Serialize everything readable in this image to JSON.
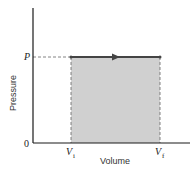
{
  "diagram": {
    "type": "pv-diagram",
    "x_axis": {
      "label": "Volume"
    },
    "y_axis": {
      "label": "Pressure"
    },
    "origin_label": "0",
    "pressure_label": "P",
    "volume_initial": {
      "main": "V",
      "sub": "i"
    },
    "volume_final": {
      "main": "V",
      "sub": "f"
    },
    "process": "isobaric expansion from Vi to Vf at constant P",
    "arrow_direction": "right",
    "colors": {
      "axis": "#1a1a1a",
      "fill": "#d0d0d0",
      "process_line": "#444444",
      "dashed": "#555555"
    }
  }
}
